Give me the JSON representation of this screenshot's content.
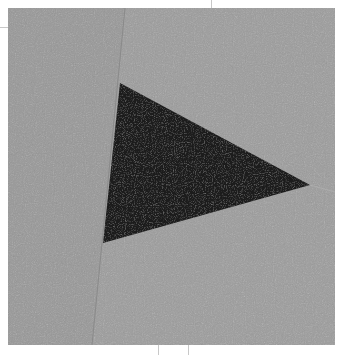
{
  "image": {
    "description": "Gray textured square with a black triangle and a faint fold line",
    "background_color": "#ffffff",
    "paper_color": "#9a9a9a",
    "paper_color_light": "#a3a3a3",
    "triangle_color": "#1c1c1c",
    "square": {
      "x": 8,
      "y": 8,
      "width": 327,
      "height": 337
    },
    "triangle_points": [
      [
        120,
        83
      ],
      [
        310,
        185
      ],
      [
        103,
        243
      ]
    ],
    "fold_line": [
      [
        125,
        8
      ],
      [
        92,
        345
      ]
    ]
  }
}
